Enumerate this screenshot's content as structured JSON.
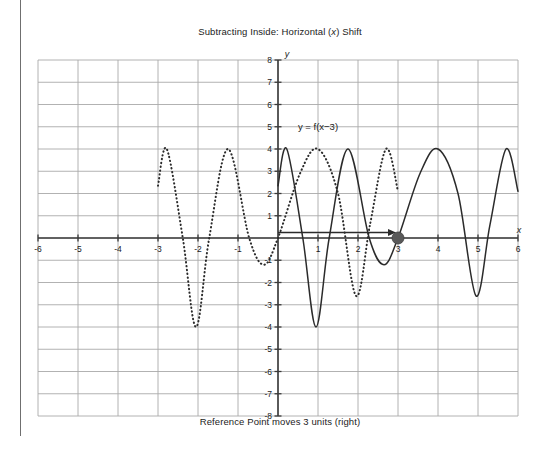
{
  "page": {
    "title_prefix": "Subtracting Inside: Horizontal (",
    "title_var": "x",
    "title_suffix": ") Shift",
    "title_full": "Subtracting Inside: Horizontal (x) Shift",
    "caption": "Reference Point moves 3 units (right)"
  },
  "colors": {
    "grid": "#a9a9a9",
    "axis": "#3a3a3a",
    "curve_solid": "#2b2b2b",
    "curve_dotted": "#2b2b2b",
    "marker": "#595959",
    "text": "#1b1b1b",
    "margin_rule": "#6f6f6f",
    "background": "#ffffff"
  },
  "chart_data": {
    "type": "line",
    "title": "Subtracting Inside: Horizontal (x) Shift",
    "subtitle": "Reference Point moves 3 units (right)",
    "xlabel": "x",
    "ylabel": "y",
    "xlim": [
      -6,
      6
    ],
    "ylim": [
      -8,
      8
    ],
    "xticks": [
      -6,
      -5,
      -4,
      -3,
      -2,
      -1,
      1,
      2,
      3,
      4,
      5,
      6
    ],
    "yticks": [
      -8,
      -7,
      -6,
      -5,
      -4,
      -3,
      -2,
      -1,
      1,
      2,
      3,
      4,
      5,
      6,
      7,
      8
    ],
    "xtick_labels": [
      "-6",
      "-5",
      "-4",
      "-3",
      "-2",
      "-1",
      "1",
      "2",
      "3",
      "4",
      "5",
      "6"
    ],
    "ytick_labels": [
      "-8",
      "-7",
      "-6",
      "-5",
      "-4",
      "-3",
      "-2",
      "-1",
      "1",
      "2",
      "3",
      "4",
      "5",
      "6",
      "7",
      "8"
    ],
    "grid": true,
    "grid_step": 1,
    "legend_position": "inline-annotation",
    "annotations": [
      {
        "name": "function-label",
        "text": "y = f(x−3)",
        "text_plain": "y = f(x-3)",
        "x": 1.0,
        "y": 4.85
      },
      {
        "name": "shift-arrow",
        "type": "arrow",
        "from_x": 0,
        "from_y": 0,
        "to_x": 3,
        "to_y": 0,
        "label": "Reference Point moves 3 units (right)"
      },
      {
        "name": "reference-point",
        "type": "point",
        "x": 3,
        "y": 0,
        "radius_px": 6
      }
    ],
    "series": [
      {
        "name": "original",
        "label": "y = f(x)",
        "style": "dotted",
        "visible_label": false,
        "x_domain": [
          -3,
          3
        ],
        "key_points": [
          {
            "x": -3.0,
            "y": 2.35
          },
          {
            "x": -2.78,
            "y": 4.0
          },
          {
            "x": -2.38,
            "y": 0.0
          },
          {
            "x": -2.05,
            "y": -4.0
          },
          {
            "x": -1.72,
            "y": 0.0
          },
          {
            "x": -1.25,
            "y": 4.0
          },
          {
            "x": -0.72,
            "y": 0.0
          },
          {
            "x": -0.35,
            "y": -1.2
          },
          {
            "x": 0.0,
            "y": 0.0
          },
          {
            "x": 0.55,
            "y": 2.9
          },
          {
            "x": 1.0,
            "y": 4.0
          },
          {
            "x": 1.5,
            "y": 2.0
          },
          {
            "x": 1.95,
            "y": -2.6
          },
          {
            "x": 2.3,
            "y": 0.6
          },
          {
            "x": 2.7,
            "y": 4.0
          },
          {
            "x": 3.0,
            "y": 2.1
          }
        ]
      },
      {
        "name": "shifted",
        "label": "y = f(x−3)",
        "style": "solid",
        "visible_label": true,
        "x_domain": [
          0,
          6
        ],
        "key_points": [
          {
            "x": 0.0,
            "y": 2.35
          },
          {
            "x": 0.22,
            "y": 4.0
          },
          {
            "x": 0.62,
            "y": 0.0
          },
          {
            "x": 0.95,
            "y": -4.0
          },
          {
            "x": 1.28,
            "y": 0.0
          },
          {
            "x": 1.75,
            "y": 4.0
          },
          {
            "x": 2.28,
            "y": 0.0
          },
          {
            "x": 2.65,
            "y": -1.2
          },
          {
            "x": 3.0,
            "y": 0.0
          },
          {
            "x": 3.55,
            "y": 2.9
          },
          {
            "x": 4.0,
            "y": 4.0
          },
          {
            "x": 4.5,
            "y": 2.0
          },
          {
            "x": 4.95,
            "y": -2.6
          },
          {
            "x": 5.3,
            "y": 0.6
          },
          {
            "x": 5.7,
            "y": 4.0
          },
          {
            "x": 6.0,
            "y": 2.1
          }
        ]
      }
    ]
  }
}
